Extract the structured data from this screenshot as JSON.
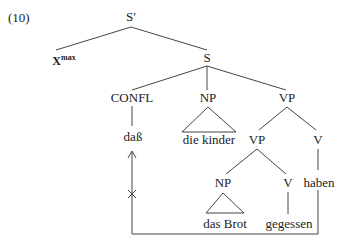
{
  "example": {
    "number": "(10)"
  },
  "nodes": {
    "s_bar": "S′",
    "x_max": {
      "base": "X",
      "superscript": "max"
    },
    "s": "S",
    "confl": "CONFL",
    "np_subject": "NP",
    "vp_upper": "VP",
    "vp_lower": "VP",
    "v_aux": "V",
    "np_object": "NP",
    "v_main": "V"
  },
  "leaves": {
    "dass": "daß",
    "die_kinder": "die kinder",
    "das_brot": "das Brot",
    "gegessen": "gegessen",
    "haben": "haben"
  },
  "annotations": {
    "blocked_movement_mark": "×",
    "arrow_description": "movement arrow from haben to daß position, blocked"
  },
  "colors": {
    "ink": "#444444",
    "text": "#222222",
    "background": "#ffffff"
  }
}
